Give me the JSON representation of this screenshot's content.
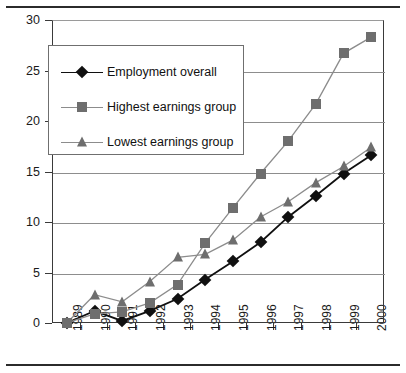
{
  "chart_data": {
    "type": "line",
    "title": "",
    "subtitle": "",
    "xlabel": "",
    "ylabel": "",
    "grid": true,
    "legend_position": "upper-left-inside",
    "categories": [
      "1989",
      "1990",
      "1991",
      "1992",
      "1993",
      "1994",
      "1995",
      "1996",
      "1997",
      "1998",
      "1999",
      "2000"
    ],
    "x_tick_labels": [
      "1989",
      "1990",
      "1991",
      "1992",
      "1993",
      "1994",
      "1995",
      "1996",
      "1997",
      "1998",
      "1999",
      "2000"
    ],
    "y_tick_labels": [
      "0",
      "5",
      "10",
      "15",
      "20",
      "25",
      "30"
    ],
    "y_ticks": [
      0,
      5,
      10,
      15,
      20,
      25,
      30
    ],
    "ylim": [
      0,
      30
    ],
    "series": [
      {
        "name": "Employment overall",
        "marker": "diamond",
        "color": "#101010",
        "values": [
          0.1,
          1.3,
          0.3,
          1.3,
          2.5,
          4.4,
          6.2,
          8.1,
          10.6,
          12.7,
          14.9,
          16.7
        ]
      },
      {
        "name": "Highest earnings group",
        "marker": "square",
        "color": "#6e6e6e",
        "values": [
          0.1,
          1.0,
          1.2,
          2.1,
          3.9,
          8.0,
          11.5,
          14.9,
          18.1,
          21.8,
          26.8,
          28.4
        ]
      },
      {
        "name": "Lowest earnings group",
        "marker": "triangle",
        "color": "#6e6e6e",
        "values": [
          0.1,
          2.9,
          2.2,
          4.2,
          6.6,
          6.9,
          8.3,
          10.6,
          12.1,
          14.0,
          15.6,
          17.5
        ]
      }
    ]
  },
  "legend": {
    "items": [
      {
        "label": "Employment overall",
        "marker": "diamond",
        "color": "#101010"
      },
      {
        "label": "Highest earnings group",
        "marker": "square",
        "color": "#6e6e6e"
      },
      {
        "label": "Lowest earnings group",
        "marker": "triangle",
        "color": "#6e6e6e"
      }
    ]
  }
}
